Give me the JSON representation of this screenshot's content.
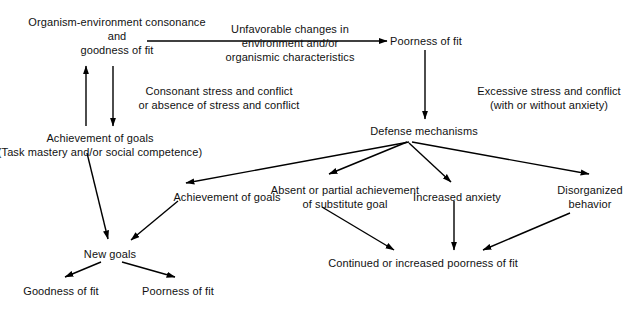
{
  "diagram": {
    "background_color": "#ffffff",
    "stroke_color": "#000000",
    "nodes": [
      {
        "id": "consonance",
        "name": "organism-environment-consonance",
        "lines": [
          "Organism-environment consonance",
          "and",
          "goodness of fit"
        ],
        "x": 117,
        "y": 15
      },
      {
        "id": "poorness-of-fit-top",
        "name": "poorness-of-fit-top",
        "lines": [
          "Poorness of fit"
        ],
        "x": 426,
        "y": 34
      },
      {
        "id": "achievement-of-goals-left",
        "name": "achievement-of-goals-left",
        "lines": [
          "Achievement of goals",
          "(Task mastery and/or social competence)"
        ],
        "x": 100,
        "y": 131
      },
      {
        "id": "defense-mechanisms",
        "name": "defense-mechanisms",
        "lines": [
          "Defense mechanisms"
        ],
        "x": 424,
        "y": 124
      },
      {
        "id": "achievement-of-goals-mid",
        "name": "achievement-of-goals-mid",
        "lines": [
          "Achievement of goals"
        ],
        "x": 227,
        "y": 190
      },
      {
        "id": "absent-or-partial",
        "name": "absent-or-partial-achievement",
        "lines": [
          "Absent or partial achievement",
          "of substitute goal"
        ],
        "x": 345,
        "y": 183
      },
      {
        "id": "increased-anxiety",
        "name": "increased-anxiety",
        "lines": [
          "Increased anxiety"
        ],
        "x": 457,
        "y": 190
      },
      {
        "id": "disorganized-behavior",
        "name": "disorganized-behavior",
        "lines": [
          "Disorganized",
          "behavior"
        ],
        "x": 590,
        "y": 183
      },
      {
        "id": "new-goals",
        "name": "new-goals",
        "lines": [
          "New goals"
        ],
        "x": 110,
        "y": 247
      },
      {
        "id": "continued-poorness",
        "name": "continued-or-increased-poorness-of-fit",
        "lines": [
          "Continued or increased poorness of fit"
        ],
        "x": 423,
        "y": 256
      },
      {
        "id": "goodness-of-fit-bottom",
        "name": "goodness-of-fit-bottom",
        "lines": [
          "Goodness of fit"
        ],
        "x": 61,
        "y": 284
      },
      {
        "id": "poorness-of-fit-bottom",
        "name": "poorness-of-fit-bottom",
        "lines": [
          "Poorness of fit"
        ],
        "x": 178,
        "y": 284
      }
    ],
    "edge_labels": [
      {
        "id": "unfavorable-changes",
        "name": "unfavorable-changes-label",
        "lines": [
          "Unfavorable changes in",
          "environment and/or",
          "organismic characteristics"
        ],
        "x": 290,
        "y": 22
      },
      {
        "id": "consonant-stress",
        "name": "consonant-stress-label",
        "lines": [
          "Consonant stress and conflict",
          "or absence of stress and conflict"
        ],
        "x": 219,
        "y": 84
      },
      {
        "id": "excessive-stress",
        "name": "excessive-stress-label",
        "lines": [
          "Excessive stress and conflict",
          "(with or without anxiety)"
        ],
        "x": 549,
        "y": 84
      }
    ],
    "edges": [
      {
        "id": "e1",
        "name": "edge-consonance-to-poorness",
        "from": "consonance",
        "to": "poorness-of-fit-top"
      },
      {
        "id": "e2",
        "name": "edge-goodness-down-to-achievement",
        "from": "consonance",
        "to": "achievement-of-goals-left"
      },
      {
        "id": "e3",
        "name": "edge-achievement-up-to-goodness",
        "from": "achievement-of-goals-left",
        "to": "consonance"
      },
      {
        "id": "e4",
        "name": "edge-poorness-to-defense",
        "from": "poorness-of-fit-top",
        "to": "defense-mechanisms"
      },
      {
        "id": "e5",
        "name": "edge-defense-to-achievement-mid",
        "from": "defense-mechanisms",
        "to": "achievement-of-goals-mid"
      },
      {
        "id": "e6",
        "name": "edge-defense-to-absent-partial",
        "from": "defense-mechanisms",
        "to": "absent-or-partial"
      },
      {
        "id": "e7",
        "name": "edge-defense-to-increased-anxiety",
        "from": "defense-mechanisms",
        "to": "increased-anxiety"
      },
      {
        "id": "e8",
        "name": "edge-defense-to-disorganized",
        "from": "defense-mechanisms",
        "to": "disorganized-behavior"
      },
      {
        "id": "e9",
        "name": "edge-achievement-left-to-new-goals",
        "from": "achievement-of-goals-left",
        "to": "new-goals"
      },
      {
        "id": "e10",
        "name": "edge-achievement-mid-to-new-goals",
        "from": "achievement-of-goals-mid",
        "to": "new-goals"
      },
      {
        "id": "e11",
        "name": "edge-new-goals-to-goodness",
        "from": "new-goals",
        "to": "goodness-of-fit-bottom"
      },
      {
        "id": "e12",
        "name": "edge-new-goals-to-poorness",
        "from": "new-goals",
        "to": "poorness-of-fit-bottom"
      },
      {
        "id": "e13",
        "name": "edge-absent-to-continued",
        "from": "absent-or-partial",
        "to": "continued-poorness"
      },
      {
        "id": "e14",
        "name": "edge-anxiety-to-continued",
        "from": "increased-anxiety",
        "to": "continued-poorness"
      },
      {
        "id": "e15",
        "name": "edge-disorganized-to-continued",
        "from": "disorganized-behavior",
        "to": "continued-poorness"
      }
    ]
  }
}
